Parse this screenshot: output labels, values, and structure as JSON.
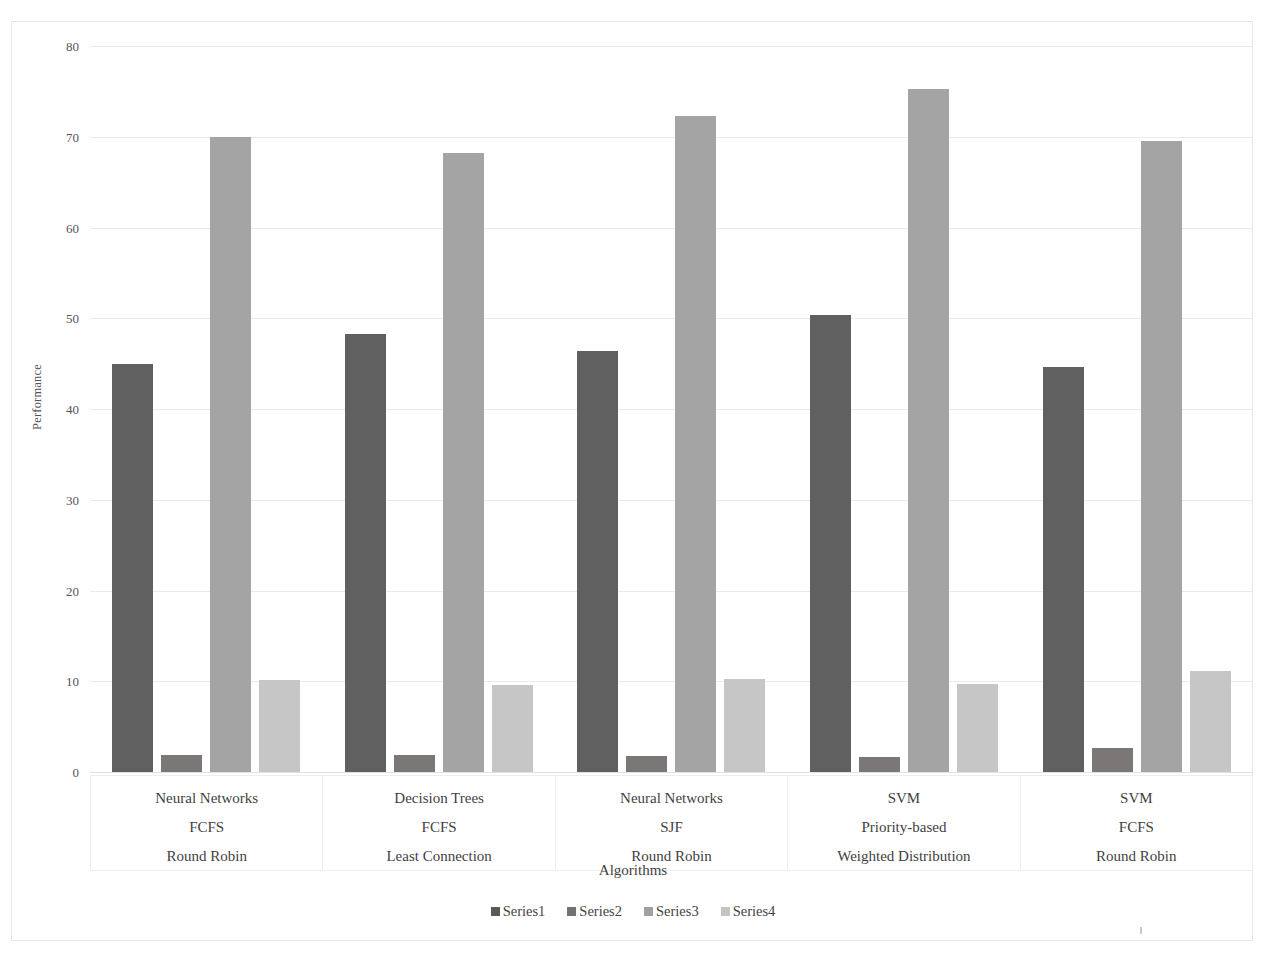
{
  "chart_data": {
    "type": "bar",
    "title": "",
    "xlabel": "Algorithms",
    "ylabel": "Performance",
    "ylim": [
      0,
      80
    ],
    "yticks": [
      0,
      10,
      20,
      30,
      40,
      50,
      60,
      70,
      80
    ],
    "grid": true,
    "legend_position": "bottom",
    "categories": [
      {
        "lines": [
          "Neural Networks",
          "FCFS",
          "Round Robin"
        ]
      },
      {
        "lines": [
          "Decision Trees",
          "FCFS",
          "Least Connection"
        ]
      },
      {
        "lines": [
          "Neural Networks",
          "SJF",
          "Round Robin"
        ]
      },
      {
        "lines": [
          "SVM",
          "Priority-based",
          "Weighted Distribution"
        ]
      },
      {
        "lines": [
          "SVM",
          "FCFS",
          "Round Robin"
        ]
      }
    ],
    "series": [
      {
        "name": "Series1",
        "color": "#595959",
        "values": [
          45.0,
          48.3,
          46.4,
          50.4,
          44.6
        ]
      },
      {
        "name": "Series2",
        "color": "#767171",
        "values": [
          1.9,
          1.9,
          1.8,
          1.6,
          2.6
        ]
      },
      {
        "name": "Series3",
        "color": "#a0a0a0",
        "values": [
          70.0,
          68.2,
          72.3,
          75.3,
          69.5
        ]
      },
      {
        "name": "Series4",
        "color": "#c4c4c4",
        "values": [
          10.1,
          9.6,
          10.2,
          9.7,
          11.1
        ]
      }
    ]
  },
  "legend": {
    "items": [
      {
        "label": "Series1",
        "color": "#595959"
      },
      {
        "label": "Series2",
        "color": "#767171"
      },
      {
        "label": "Series3",
        "color": "#a0a0a0"
      },
      {
        "label": "Series4",
        "color": "#c4c4c4"
      }
    ]
  }
}
